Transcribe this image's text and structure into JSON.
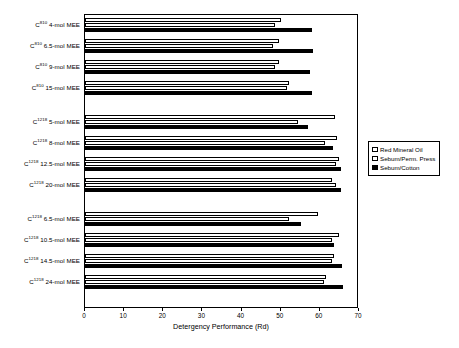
{
  "chart_data": {
    "type": "bar",
    "orientation": "horizontal",
    "title": "",
    "xlabel": "Detergency Performance (Rd)",
    "ylabel": "",
    "xlim": [
      0,
      70
    ],
    "xticks": [
      0,
      10,
      20,
      30,
      40,
      50,
      60,
      70
    ],
    "xticklabels": [
      "0",
      "10",
      "20",
      "30",
      "40",
      "50",
      "60",
      "70"
    ],
    "grid": false,
    "legend_position": "right",
    "legend": [
      "Red Mineral Oil",
      "Sebum/Perm. Press",
      "Sebum/Cotton"
    ],
    "series": [
      {
        "name": "Red Mineral Oil",
        "color": "#ffffff",
        "edge": "#000000",
        "values": [
          50.0,
          49.5,
          49.5,
          52.0,
          63.8,
          64.5,
          65.0,
          63.0,
          59.5,
          65.0,
          63.6,
          61.6
        ]
      },
      {
        "name": "Sebum/Perm. Press",
        "color": "#ffffff",
        "edge": "#000000",
        "values": [
          48.5,
          48.0,
          48.5,
          51.5,
          54.5,
          61.3,
          64.0,
          64.0,
          52.0,
          63.0,
          63.0,
          61.0
        ]
      },
      {
        "name": "Sebum/Cotton",
        "color": "#000000",
        "edge": "#000000",
        "values": [
          58.0,
          58.3,
          57.5,
          58.0,
          57.0,
          63.4,
          65.5,
          65.3,
          55.3,
          63.6,
          65.6,
          66.0
        ]
      }
    ],
    "categories": [
      {
        "prefix": "C",
        "superscript": "810",
        "suffix": " 4-mol MEE",
        "full": "C810 4-mol MEE",
        "group": 1
      },
      {
        "prefix": "C",
        "superscript": "810",
        "suffix": " 6.5-mol MEE",
        "full": "C810 6.5-mol MEE",
        "group": 1
      },
      {
        "prefix": "C",
        "superscript": "810",
        "suffix": " 9-mol MEE",
        "full": "C810 9-mol MEE",
        "group": 1
      },
      {
        "prefix": "C",
        "superscript": "810",
        "suffix": " 15-mol MEE",
        "full": "C810 15-mol MEE",
        "group": 1
      },
      {
        "prefix": "C",
        "superscript": "1218",
        "suffix": " 5-mol MEE",
        "full": "C1218 5-mol MEE",
        "group": 2
      },
      {
        "prefix": "C",
        "superscript": "1218",
        "suffix": " 8-mol MEE",
        "full": "C1218 8-mol MEE",
        "group": 2
      },
      {
        "prefix": "C",
        "superscript": "1218",
        "suffix": " 12.5-mol MEE",
        "full": "C1218 12.5-mol MEE",
        "group": 2
      },
      {
        "prefix": "C",
        "superscript": "1218",
        "suffix": " 20-mol MEE",
        "full": "C1218 20-mol MEE",
        "group": 2
      },
      {
        "prefix": "C",
        "superscript": "1218",
        "suffix": " 6.5-mol MEE",
        "full": "C1218 6.5-mol MEE",
        "group": 3
      },
      {
        "prefix": "C",
        "superscript": "1218",
        "suffix": " 10.5-mol MEE",
        "full": "C1218 10.5-mol MEE",
        "group": 3
      },
      {
        "prefix": "C",
        "superscript": "1218",
        "suffix": " 14.5-mol MEE",
        "full": "C1218 14.5-mol MEE",
        "group": 3
      },
      {
        "prefix": "C",
        "superscript": "1218",
        "suffix": " 24-mol MEE",
        "full": "C1218 24-mol MEE",
        "group": 3
      }
    ]
  }
}
